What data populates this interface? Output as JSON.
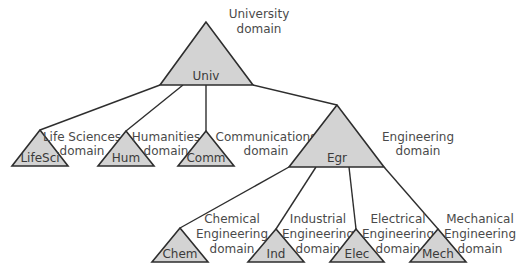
{
  "diagram": {
    "type": "domain-hierarchy-tree",
    "colors": {
      "fill": "#d3d3d3",
      "stroke": "#2e2e2e",
      "text": "#3a3a3a"
    },
    "nodes": {
      "univ": {
        "label": "Univ",
        "domain_lines": [
          "University",
          "domain"
        ]
      },
      "lifesci": {
        "label": "LifeSci",
        "domain_lines": [
          "Life Sciences",
          "domain"
        ]
      },
      "hum": {
        "label": "Hum",
        "domain_lines": [
          "Humanities",
          "domain"
        ]
      },
      "comm": {
        "label": "Comm",
        "domain_lines": [
          "Communications",
          "domain"
        ]
      },
      "egr": {
        "label": "Egr",
        "domain_lines": [
          "Engineering",
          "domain"
        ]
      },
      "chem": {
        "label": "Chem",
        "domain_lines": [
          "Chemical",
          "Engineering",
          "domain"
        ]
      },
      "ind": {
        "label": "Ind",
        "domain_lines": [
          "Industrial",
          "Engineering",
          "domain"
        ]
      },
      "elec": {
        "label": "Elec",
        "domain_lines": [
          "Electrical",
          "Engineering",
          "domain"
        ]
      },
      "mech": {
        "label": "Mech",
        "domain_lines": [
          "Mechanical",
          "Engineering",
          "domain"
        ]
      }
    },
    "edges": [
      [
        "univ",
        "lifesci"
      ],
      [
        "univ",
        "hum"
      ],
      [
        "univ",
        "comm"
      ],
      [
        "univ",
        "egr"
      ],
      [
        "egr",
        "chem"
      ],
      [
        "egr",
        "ind"
      ],
      [
        "egr",
        "elec"
      ],
      [
        "egr",
        "mech"
      ]
    ]
  }
}
